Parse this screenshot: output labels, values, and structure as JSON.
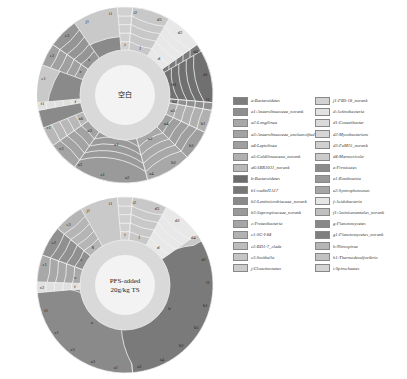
{
  "chart_data": [
    {
      "type": "sunburst",
      "title": "空白",
      "center_label": "空白",
      "rings": 5,
      "segments": [
        {
          "label": "a",
          "start_deg": 95,
          "end_deg": 260,
          "color": "#8a8a8a"
        },
        {
          "label": "a1",
          "start_deg": 165,
          "end_deg": 215,
          "color": "#9a9a9a"
        },
        {
          "label": "a2",
          "start_deg": 135,
          "end_deg": 165,
          "color": "#a8a8a8"
        },
        {
          "label": "a3",
          "start_deg": 215,
          "end_deg": 235,
          "color": "#a3a3a3"
        },
        {
          "label": "a4",
          "start_deg": 115,
          "end_deg": 135,
          "color": "#9f9f9f"
        },
        {
          "label": "a5",
          "start_deg": 100,
          "end_deg": 115,
          "color": "#b0b0b0"
        },
        {
          "label": "a6",
          "start_deg": 235,
          "end_deg": 248,
          "color": "#b8b8b8"
        },
        {
          "label": "b",
          "start_deg": 55,
          "end_deg": 95,
          "color": "#7a7a7a"
        },
        {
          "label": "b1",
          "start_deg": 60,
          "end_deg": 95,
          "color": "#707070"
        },
        {
          "label": "b2",
          "start_deg": 95,
          "end_deg": 100,
          "color": "#8f8f8f"
        },
        {
          "label": "c",
          "start_deg": 290,
          "end_deg": 305,
          "color": "#a0a0a0"
        },
        {
          "label": "d",
          "start_deg": 30,
          "end_deg": 55,
          "color": "#e8e8e8"
        },
        {
          "label": "e",
          "start_deg": 305,
          "end_deg": 325,
          "color": "#959595"
        },
        {
          "label": "f",
          "start_deg": 260,
          "end_deg": 265,
          "color": "#e0e0e0"
        },
        {
          "label": "i",
          "start_deg": 355,
          "end_deg": 5,
          "color": "#d0d0d0"
        },
        {
          "label": "j",
          "start_deg": 5,
          "end_deg": 30,
          "color": "#c8c8c8"
        }
      ],
      "outer_labels": [
        "i1",
        "i2",
        "d3",
        "d2",
        "d4",
        "d1",
        "l1",
        "b1",
        "b3",
        "b2",
        "a4",
        "a2",
        "a1",
        "a3",
        "c3",
        "c1",
        "f1",
        "e1",
        "e2",
        "e3",
        "j1"
      ]
    },
    {
      "type": "sunburst",
      "title": "PFS-added 20g/kg TS",
      "center_label": "PFS-added\n20g/kg TS",
      "rings": 5,
      "segments": [
        {
          "label": "a",
          "start_deg": 175,
          "end_deg": 268,
          "color": "#8a8a8a"
        },
        {
          "label": "b",
          "start_deg": 60,
          "end_deg": 175,
          "color": "#7a7a7a"
        },
        {
          "label": "c",
          "start_deg": 268,
          "end_deg": 290,
          "color": "#a8a8a8"
        },
        {
          "label": "e",
          "start_deg": 290,
          "end_deg": 310,
          "color": "#909090"
        },
        {
          "label": "f",
          "start_deg": 265,
          "end_deg": 272,
          "color": "#e0e0e0"
        },
        {
          "label": "g",
          "start_deg": 310,
          "end_deg": 330,
          "color": "#b5b5b5"
        },
        {
          "label": "d",
          "start_deg": 28,
          "end_deg": 55,
          "color": "#e8e8e8"
        },
        {
          "label": "i",
          "start_deg": 355,
          "end_deg": 5,
          "color": "#d0d0d0"
        },
        {
          "label": "j",
          "start_deg": 5,
          "end_deg": 28,
          "color": "#c8c8c8"
        }
      ],
      "outer_labels": [
        "i1",
        "i2",
        "d3",
        "d2",
        "d4",
        "d1",
        "l1",
        "b1",
        "b3",
        "b2",
        "a4",
        "a2",
        "a1",
        "a3",
        "c3",
        "c1",
        "f1",
        "c2",
        "e1",
        "e2",
        "e3",
        "j1"
      ]
    }
  ],
  "charts": {
    "top": {
      "center": "空白"
    },
    "bottom": {
      "center_line1": "PFS-added",
      "center_line2": "20g/kg TS"
    }
  },
  "legend": [
    {
      "label": "a:Bacteroidetes",
      "color": "#7d7d7d"
    },
    {
      "label": "a1:Anaerolineaceae_norank",
      "color": "#8f8f8f"
    },
    {
      "label": "a2:Longilinea",
      "color": "#a8a8a8"
    },
    {
      "label": "a3:Anaerolineaceae_uncluassified",
      "color": "#a3a3a3"
    },
    {
      "label": "a4:Leptolinea",
      "color": "#9f9f9f"
    },
    {
      "label": "a5:Caldilineaceae_norank",
      "color": "#b0b0b0"
    },
    {
      "label": "a6:SBR1031_norank",
      "color": "#b8b8b8"
    },
    {
      "label": "b:Bacteroidetes",
      "color": "#6c6c6c"
    },
    {
      "label": "b1:vadinHA17",
      "color": "#777777"
    },
    {
      "label": "b2:Lentimicrobiaceae_norank",
      "color": "#8a8a8a"
    },
    {
      "label": "b3:Saprospiraceae_norank",
      "color": "#9a9a9a"
    },
    {
      "label": "c:Proteobacteria",
      "color": "#a5a5a5"
    },
    {
      "label": "c1:SC-I-84",
      "color": "#b2b2b2"
    },
    {
      "label": "c2:BD1-7_clade",
      "color": "#bdbdbd"
    },
    {
      "label": "c3:Smithella",
      "color": "#c5c5c5"
    },
    {
      "label": "j:Cloacimonetes",
      "color": "#cccccc"
    },
    {
      "label": "j1:PBS-18_norank",
      "color": "#d2d2d2"
    },
    {
      "label": "d:Actinobacteria",
      "color": "#e2e2e2"
    },
    {
      "label": "d1:Conexibacter",
      "color": "#dadada"
    },
    {
      "label": "d2:Mycobacterium",
      "color": "#d6d6d6"
    },
    {
      "label": "d3:PeM15_norank",
      "color": "#d0d0d0"
    },
    {
      "label": "d4:Marmoricola",
      "color": "#cbcbcb"
    },
    {
      "label": "e:Firmicutes",
      "color": "#8c8c8c"
    },
    {
      "label": "e1:Romboutsia",
      "color": "#999999"
    },
    {
      "label": "e2:Syntrophomonas",
      "color": "#a6a6a6"
    },
    {
      "label": "f:Acidobacteria",
      "color": "#e6e6e6"
    },
    {
      "label": "f1:Aminicenantales_norank",
      "color": "#c0c0c0"
    },
    {
      "label": "g:Planctomycetes",
      "color": "#888888"
    },
    {
      "label": "g1:Planctomycetes_norank",
      "color": "#7f7f7f"
    },
    {
      "label": "h:Nitrospirae",
      "color": "#b6b6b6"
    },
    {
      "label": "h1:Thermodesulfovibrio",
      "color": "#c2c2c2"
    },
    {
      "label": "i:Spirochaetes",
      "color": "#d4d4d4"
    },
    {
      "label": "i1:RBG-16-49-21",
      "color": "#dcdcdc"
    }
  ]
}
